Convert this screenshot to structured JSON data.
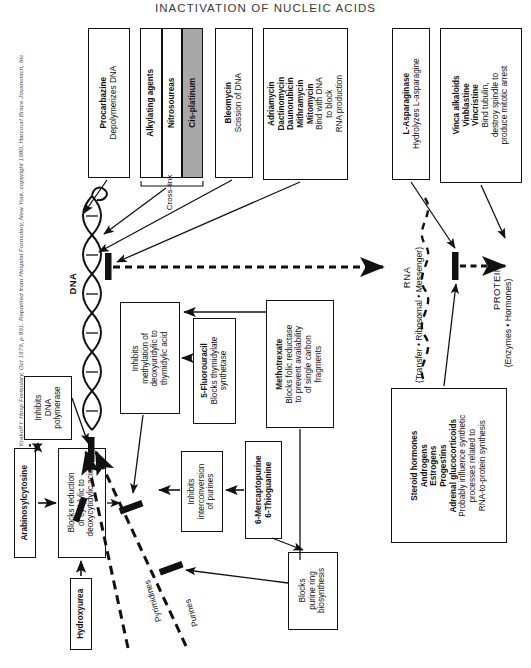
{
  "title": "INACTIVATION OF NUCLEIC ACIDS",
  "credit": "From Goldberg RS, Krakoff I: Hosp Formulary, Oct 1979, p 891. Reprinted from Hospital Formulary, New York, copyright 1980, Harcourt Brace Jovanovich, Inc.",
  "colors": {
    "ink": "#111111",
    "paper": "#ffffff",
    "shaded_box": "#a8a8a8",
    "title_gray": "#3a3a3a"
  },
  "top_boxes": [
    {
      "id": "procarbazine",
      "bold_lines": [
        "Procarbazine"
      ],
      "plain_lines": [
        "Depolymerizes DNA"
      ],
      "shaded": false
    },
    {
      "id": "alkylating-agents",
      "bold_lines": [
        "Alkylating agents"
      ],
      "plain_lines": [],
      "shaded": false
    },
    {
      "id": "nitrosoureas",
      "bold_lines": [
        "Nitrosoureas"
      ],
      "plain_lines": [],
      "shaded": false
    },
    {
      "id": "cis-platinum",
      "bold_lines": [
        "Cis-platinum"
      ],
      "plain_lines": [],
      "shaded": true
    },
    {
      "id": "bleomycin",
      "bold_lines": [
        "Bleomycin"
      ],
      "plain_lines": [
        "Scission of DNA"
      ],
      "shaded": false
    },
    {
      "id": "anthracyclines",
      "bold_lines": [
        "Adriamycin",
        "Dactinomycin",
        "Daunorubicin",
        "Mithramycin",
        "Mitomycin"
      ],
      "plain_lines": [
        "Bind with DNA",
        "to block",
        "RNA production"
      ],
      "shaded": false
    },
    {
      "id": "l-asparaginase",
      "bold_lines": [
        "L-Asparaginase"
      ],
      "plain_lines": [
        "Hydrolyzes L-asparagine"
      ],
      "shaded": false
    },
    {
      "id": "vinca-alkaloids",
      "bold_lines": [
        "Vinca alkaloids",
        "Vinblastine",
        "Vincristine"
      ],
      "plain_lines": [
        "Bind tubulin,",
        "destroy spindle to",
        "produce mitotic arrest"
      ],
      "shaded": false
    }
  ],
  "crosslink_label": "Cross-link",
  "pathway_labels": {
    "dna": "DNA",
    "rna": "RNA",
    "rna_sub": "(Transfer • Ribosomal • Messenger)",
    "protein": "PROTEIN",
    "protein_sub": "(Enzymes • Hormones)",
    "pyrimidines": "Pyrimidines",
    "purines": "Purines"
  },
  "lower_boxes": [
    {
      "id": "arabinosylcytosine",
      "bold_lines": [
        "Arabinosylcytosine"
      ],
      "plain_lines": []
    },
    {
      "id": "inhibits-dna-polymerase",
      "bold_lines": [],
      "plain_lines": [
        "Inhibits",
        "DNA",
        "polymerase"
      ]
    },
    {
      "id": "blocks-reduction",
      "bold_lines": [],
      "plain_lines": [
        "Blocks reduction",
        "of cytidylic to",
        "deoxycytidylic acid"
      ]
    },
    {
      "id": "hydroxyurea",
      "bold_lines": [
        "Hydroxyurea"
      ],
      "plain_lines": []
    },
    {
      "id": "inhibits-methylation",
      "bold_lines": [],
      "plain_lines": [
        "Inhibits",
        "methylation of",
        "deoxyuridylic to",
        "thymidylic acid"
      ]
    },
    {
      "id": "5-fluorouracil",
      "bold_lines": [
        "5-Fluorouracil"
      ],
      "plain_lines": [
        "Blocks thymidylate",
        "synthetase"
      ]
    },
    {
      "id": "methotrexate",
      "bold_lines": [
        "Methotrexate"
      ],
      "plain_lines": [
        "Blocks folic reductase",
        "to prevent availability",
        "of single carbon",
        "fragments"
      ]
    },
    {
      "id": "inhibits-interconversion",
      "bold_lines": [],
      "plain_lines": [
        "Inhibits",
        "interconversion",
        "of purines"
      ]
    },
    {
      "id": "thiopurines",
      "bold_lines": [
        "6-Mercaptopurine",
        "6-Thioguanine"
      ],
      "plain_lines": []
    },
    {
      "id": "blocks-purine-ring",
      "bold_lines": [],
      "plain_lines": [
        "Blocks",
        "purine ring",
        "biosynthesis"
      ]
    },
    {
      "id": "steroid-hormones",
      "bold_lines": [
        "Steroid hormones",
        "Androgens",
        "Estrogens",
        "Progestins",
        "Adrenal glucocorticoids"
      ],
      "plain_lines": [
        "Probably influence synthetic",
        "processes related to",
        "RNA-to-protein synthesis"
      ]
    }
  ]
}
